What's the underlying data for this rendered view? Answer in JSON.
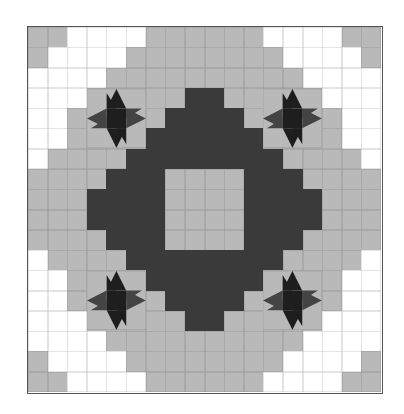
{
  "figure": {
    "title": "",
    "colors": {
      "W": "#ffffff",
      "L": "#b9b9b9",
      "D": "#3a3a3a",
      "star": "#1e1e1e",
      "star_shade": "#444444",
      "border": "#555555"
    },
    "grid": {
      "cols": 18,
      "rows": 18
    },
    "cells": [
      "LLWWWWLLLLLLWWWWLL",
      "LWWWWLLLLLLLLWWWWL",
      "WWWWLLLLLLLLLLWWWW",
      "WWWLLLLLDDLLLLLWWW",
      "WWLLLLLDDDDLLLLLWW",
      "WWLLLLDDDDDDLLLLWW",
      "WLLLLDDDDDDDDLLLLW",
      "LLLLDDDLLLLDDDLLLL",
      "LLLDDDDLLLLDDDDLLL",
      "LLLDDDDLLLLDDDDLLL",
      "LLLLDDDLLLLDDDLLLL",
      "WLLLLDDDDDDDDLLLLW",
      "WWLLLLDDDDDDLLLLWW",
      "WWLLLLLDDDDLLLLLWW",
      "WWWLLLLLDDLLLLLWWW",
      "WWWWLLLLLLLLLLWWWW",
      "LWWWWLLLLLLLLWWWWL",
      "LLWWWWLLLLLLWWWWLL"
    ],
    "stars": [
      {
        "name": "star-top-left",
        "col": 3,
        "row": 3
      },
      {
        "name": "star-top-right",
        "col": 12,
        "row": 3
      },
      {
        "name": "star-bottom-left",
        "col": 3,
        "row": 12
      },
      {
        "name": "star-bottom-right",
        "col": 12,
        "row": 12
      }
    ]
  }
}
